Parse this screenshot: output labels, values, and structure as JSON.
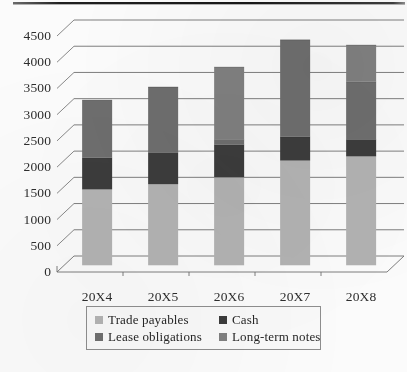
{
  "chart_data": {
    "type": "bar",
    "subtype": "stacked-column-3d",
    "title": "",
    "subtitle": "",
    "xlabel": "",
    "ylabel": "",
    "categories": [
      "20X4",
      "20X5",
      "20X6",
      "20X7",
      "20X8"
    ],
    "series": [
      {
        "name": "Trade payables",
        "color": "#b4b4b4",
        "values": [
          1450,
          1550,
          1680,
          2000,
          2080
        ]
      },
      {
        "name": "Cash",
        "color": "#3a3a3a",
        "values": [
          600,
          600,
          620,
          450,
          320
        ]
      },
      {
        "name": "Lease obligations",
        "color": "#6d6d6d",
        "values": [
          1100,
          1250,
          100,
          1850,
          1100
        ]
      },
      {
        "name": "Long-term notes",
        "color": "#808080",
        "values": [
          0,
          0,
          1380,
          0,
          700
        ]
      }
    ],
    "totals": [
      3150,
      3400,
      3780,
      4300,
      4200
    ],
    "ylim": [
      0,
      4500
    ],
    "ytick_step": 500,
    "yticks": [
      "0",
      "500",
      "1000",
      "1500",
      "2000",
      "2500",
      "3000",
      "3500",
      "4000",
      "4500"
    ],
    "grid": true,
    "grid_axis": "y",
    "legend_position": "bottom",
    "legend_layout": "2x2"
  },
  "legend": {
    "items": [
      {
        "label": "Trade payables",
        "color": "#b4b4b4"
      },
      {
        "label": "Cash",
        "color": "#3a3a3a"
      },
      {
        "label": "Lease obligations",
        "color": "#6d6d6d"
      },
      {
        "label": "Long-term notes",
        "color": "#808080"
      }
    ]
  },
  "axes": {
    "y_ticks": [
      "4500",
      "4000",
      "3500",
      "3000",
      "2500",
      "2000",
      "1500",
      "1000",
      "500",
      "0"
    ],
    "x_ticks": [
      "20X4",
      "20X5",
      "20X6",
      "20X7",
      "20X8"
    ]
  }
}
